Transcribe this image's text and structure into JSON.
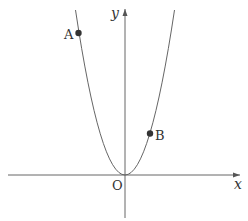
{
  "diagram": {
    "type": "coordinate-graph",
    "curve": "parabola y = a x^2 (a > 0), vertex at origin",
    "axes": {
      "x_label": "x",
      "y_label": "y",
      "origin_label": "O"
    },
    "points": [
      {
        "label": "A",
        "position": "on left branch, upper"
      },
      {
        "label": "B",
        "position": "on right branch, middle"
      }
    ],
    "colors": {
      "line": "#555555",
      "point": "#333333",
      "text": "#333333"
    }
  }
}
